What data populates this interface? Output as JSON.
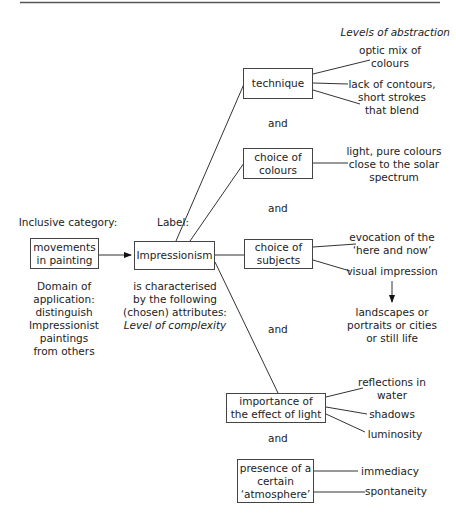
{
  "header": {
    "rule": true,
    "levels_of_abstraction": "Levels of abstraction"
  },
  "left": {
    "inclusive_category_label": "Inclusive category:",
    "category_box": "movements\nin painting",
    "domain_text": "Domain of\napplication:\ndistinguish\nImpressionist\npaintings\nfrom others"
  },
  "center": {
    "label_caption": "Label:",
    "label_box": "Impressionism",
    "characterised_text": "is characterised\nby the following\n(chosen) attributes:",
    "level_of_complexity": "Level of complexity"
  },
  "attributes": [
    {
      "name": "technique",
      "box": "technique",
      "details": [
        "optic mix of\ncolours",
        "lack of contours,\nshort strokes\nthat blend"
      ]
    },
    {
      "name": "choice-of-colours",
      "box": "choice of\ncolours",
      "details": [
        "light, pure colours\nclose to the solar\nspectrum"
      ]
    },
    {
      "name": "choice-of-subjects",
      "box": "choice of\nsubjects",
      "details": [
        "evocation of the\n‘here and now’",
        "visual impression",
        "landscapes or\nportraits or cities\nor still life"
      ]
    },
    {
      "name": "effect-of-light",
      "box": "importance of\nthe effect of light",
      "details": [
        "reflections in\nwater",
        "shadows",
        "luminosity"
      ]
    },
    {
      "name": "atmosphere",
      "box": "presence of a\ncertain\n‘atmosphere’",
      "details": [
        "immediacy",
        "spontaneity"
      ]
    }
  ],
  "connectors": {
    "and": "and"
  }
}
